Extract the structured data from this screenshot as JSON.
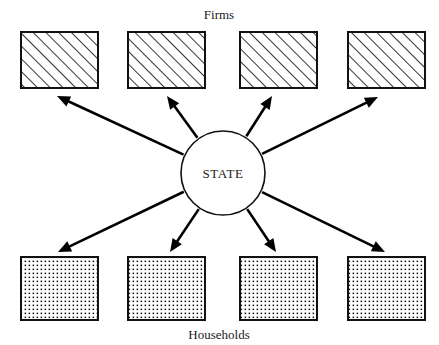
{
  "diagram": {
    "title_top": "Firms",
    "title_bottom": "Households",
    "center_node": {
      "label": "STATE",
      "shape": "circle",
      "cx": 223,
      "cy": 173,
      "r": 42
    },
    "colors": {
      "background": "#ffffff",
      "stroke": "#111111",
      "arrow": "#000000",
      "text": "#1a1a1a",
      "hatch_fill": "#ffffff",
      "dot_fill": "#ffffff"
    },
    "firms": [
      {
        "id": "firm-1",
        "label": "",
        "x": 21,
        "y": 32,
        "w": 77,
        "h": 56,
        "fill": "hatch"
      },
      {
        "id": "firm-2",
        "label": "",
        "x": 128,
        "y": 32,
        "w": 77,
        "h": 56,
        "fill": "hatch"
      },
      {
        "id": "firm-3",
        "label": "",
        "x": 240,
        "y": 32,
        "w": 77,
        "h": 56,
        "fill": "hatch"
      },
      {
        "id": "firm-4",
        "label": "",
        "x": 348,
        "y": 32,
        "w": 77,
        "h": 56,
        "fill": "hatch"
      }
    ],
    "households": [
      {
        "id": "household-1",
        "label": "",
        "x": 21,
        "y": 257,
        "w": 77,
        "h": 63,
        "fill": "dots"
      },
      {
        "id": "household-2",
        "label": "",
        "x": 128,
        "y": 257,
        "w": 77,
        "h": 63,
        "fill": "dots"
      },
      {
        "id": "household-3",
        "label": "",
        "x": 240,
        "y": 257,
        "w": 77,
        "h": 63,
        "fill": "dots"
      },
      {
        "id": "household-4",
        "label": "",
        "x": 348,
        "y": 257,
        "w": 77,
        "h": 63,
        "fill": "dots"
      }
    ],
    "arrows": [
      {
        "id": "arrow-state-to-firm-1",
        "from": "state",
        "to": "firm-1",
        "tip_x": 57,
        "tip_y": 96
      },
      {
        "id": "arrow-state-to-firm-2",
        "from": "state",
        "to": "firm-2",
        "tip_x": 167,
        "tip_y": 96
      },
      {
        "id": "arrow-state-to-firm-3",
        "from": "state",
        "to": "firm-3",
        "tip_x": 272,
        "tip_y": 96
      },
      {
        "id": "arrow-state-to-firm-4",
        "from": "state",
        "to": "firm-4",
        "tip_x": 378,
        "tip_y": 97
      },
      {
        "id": "arrow-state-to-household-1",
        "from": "state",
        "to": "household-1",
        "tip_x": 58,
        "tip_y": 252
      },
      {
        "id": "arrow-state-to-household-2",
        "from": "state",
        "to": "household-2",
        "tip_x": 170,
        "tip_y": 252
      },
      {
        "id": "arrow-state-to-household-3",
        "from": "state",
        "to": "household-3",
        "tip_x": 276,
        "tip_y": 252
      },
      {
        "id": "arrow-state-to-household-4",
        "from": "state",
        "to": "household-4",
        "tip_x": 385,
        "tip_y": 252
      }
    ],
    "title_top_pos": {
      "x": 219,
      "y": 19
    },
    "title_bottom_pos": {
      "x": 219,
      "y": 339
    }
  }
}
